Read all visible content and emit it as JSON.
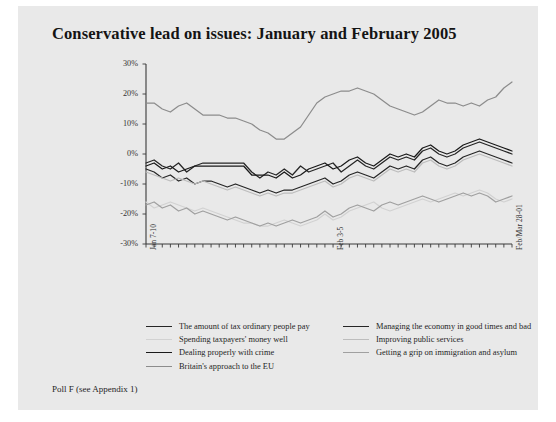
{
  "figure": {
    "title": "Conservative lead on issues: January and February 2005",
    "footnote": "Poll F (see Appendix 1)",
    "background": "#e9e9e9",
    "page_background": "#ffffff"
  },
  "chart_data": {
    "type": "line",
    "title": "Conservative lead on issues: January and February 2005",
    "xlabel": "",
    "ylabel": "",
    "ylim": [
      -30,
      30
    ],
    "ytick_labels": [
      "30%",
      "20%",
      "10%",
      "0%",
      "-10%",
      "-20%",
      "-30%"
    ],
    "ytick_values": [
      30,
      20,
      10,
      0,
      -10,
      -20,
      -30
    ],
    "xtick_labels": [
      "Jan 7-10",
      "Feb 3-5",
      "Feb/Mar 28-01"
    ],
    "xtick_positions": [
      0,
      23,
      45
    ],
    "x_count": 46,
    "grid": false,
    "legend_position": "below",
    "series": [
      {
        "name": "The amount of tax ordinary people pay",
        "color": "#262626",
        "width": 1.5,
        "values": [
          -3,
          -2,
          -4,
          -5,
          -3,
          -6,
          -4,
          -3,
          -3,
          -3,
          -3,
          -3,
          -3,
          -6,
          -8,
          -6,
          -7,
          -5,
          -7,
          -4,
          -6,
          -5,
          -4,
          -3,
          -6,
          -4,
          -2,
          -4,
          -5,
          -3,
          -1,
          -2,
          -1,
          -2,
          1,
          2,
          0,
          -1,
          0,
          2,
          3,
          4,
          3,
          2,
          1,
          0
        ]
      },
      {
        "name": "Spending taxpayers' money well",
        "color": "#d2d2d2",
        "width": 1.4,
        "values": [
          -16,
          -18,
          -17,
          -16,
          -17,
          -18,
          -19,
          -18,
          -19,
          -20,
          -21,
          -22,
          -23,
          -23,
          -24,
          -24,
          -23,
          -22,
          -23,
          -24,
          -23,
          -22,
          -20,
          -22,
          -21,
          -19,
          -18,
          -17,
          -16,
          -18,
          -19,
          -18,
          -17,
          -16,
          -15,
          -16,
          -15,
          -14,
          -13,
          -14,
          -13,
          -12,
          -13,
          -15,
          -16,
          -15
        ]
      },
      {
        "name": "Dealing properly with crime",
        "color": "#1a1a1a",
        "width": 1.7,
        "values": [
          -4,
          -3,
          -5,
          -4,
          -6,
          -5,
          -4,
          -4,
          -4,
          -4,
          -4,
          -4,
          -4,
          -7,
          -7,
          -7,
          -8,
          -6,
          -8,
          -7,
          -5,
          -4,
          -3,
          -5,
          -4,
          -2,
          -1,
          -3,
          -4,
          -2,
          0,
          -1,
          0,
          -1,
          2,
          3,
          1,
          0,
          1,
          3,
          4,
          5,
          4,
          3,
          2,
          1
        ]
      },
      {
        "name": "Britain's approach to the EU",
        "color": "#8c8c8c",
        "width": 1.4,
        "values": [
          17,
          17,
          15,
          14,
          16,
          17,
          15,
          13,
          13,
          13,
          12,
          12,
          11,
          10,
          8,
          7,
          5,
          5,
          7,
          9,
          13,
          17,
          19,
          20,
          21,
          21,
          22,
          21,
          20,
          18,
          16,
          15,
          14,
          13,
          14,
          16,
          18,
          17,
          17,
          16,
          17,
          16,
          18,
          19,
          22,
          24
        ]
      },
      {
        "name": "Managing the economy in good times and bad",
        "color": "#262626",
        "width": 1.5,
        "values": [
          -5,
          -6,
          -8,
          -7,
          -9,
          -8,
          -10,
          -9,
          -9,
          -10,
          -11,
          -10,
          -11,
          -12,
          -13,
          -12,
          -13,
          -12,
          -12,
          -11,
          -10,
          -9,
          -8,
          -10,
          -9,
          -7,
          -6,
          -7,
          -8,
          -6,
          -4,
          -5,
          -4,
          -5,
          -2,
          -1,
          -3,
          -4,
          -3,
          -1,
          0,
          1,
          0,
          -1,
          -2,
          -3
        ]
      },
      {
        "name": "Improving public services",
        "color": "#bdbdbd",
        "width": 1.4,
        "values": [
          -6,
          -7,
          -8,
          -9,
          -8,
          -9,
          -10,
          -9,
          -10,
          -11,
          -12,
          -11,
          -12,
          -13,
          -14,
          -13,
          -14,
          -13,
          -13,
          -12,
          -11,
          -10,
          -9,
          -11,
          -10,
          -8,
          -7,
          -8,
          -9,
          -7,
          -5,
          -6,
          -5,
          -6,
          -3,
          -2,
          -4,
          -5,
          -4,
          -2,
          -1,
          0,
          -1,
          -2,
          -3,
          -4
        ]
      },
      {
        "name": "Getting a grip on immigration and asylum",
        "color": "#a0a0a0",
        "width": 1.4,
        "values": [
          -17,
          -16,
          -18,
          -17,
          -19,
          -18,
          -20,
          -19,
          -20,
          -21,
          -22,
          -21,
          -22,
          -23,
          -24,
          -23,
          -24,
          -23,
          -22,
          -23,
          -22,
          -21,
          -19,
          -21,
          -20,
          -18,
          -17,
          -18,
          -19,
          -17,
          -16,
          -17,
          -16,
          -15,
          -14,
          -15,
          -16,
          -15,
          -14,
          -13,
          -14,
          -13,
          -14,
          -16,
          -15,
          -14
        ]
      }
    ]
  },
  "legend": {
    "left_column": [
      {
        "label": "The amount of tax ordinary people pay",
        "color": "#262626",
        "width": 1.6
      },
      {
        "label": "Spending taxpayers' money well",
        "color": "#d2d2d2",
        "width": 1.5
      },
      {
        "label": "Dealing properly with crime",
        "color": "#1a1a1a",
        "width": 1.9
      },
      {
        "label": "Britain's approach to the EU",
        "color": "#8c8c8c",
        "width": 1.5
      }
    ],
    "right_column": [
      {
        "label": "Managing the economy in good times and bad",
        "color": "#262626",
        "width": 1.6
      },
      {
        "label": "Improving public services",
        "color": "#bdbdbd",
        "width": 1.5
      },
      {
        "label": "Getting a grip on immigration and asylum",
        "color": "#a0a0a0",
        "width": 1.5
      }
    ]
  }
}
